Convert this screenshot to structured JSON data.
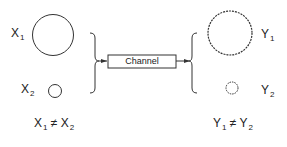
{
  "diagram": {
    "inputs": [
      {
        "symbol": "X",
        "subscript": "1",
        "size": "large"
      },
      {
        "symbol": "X",
        "subscript": "2",
        "size": "small"
      }
    ],
    "input_relation": {
      "left": "X",
      "left_sub": "1",
      "op": "≠",
      "right": "X",
      "right_sub": "2"
    },
    "channel": {
      "label": "Channel"
    },
    "outputs": [
      {
        "symbol": "Y",
        "subscript": "1",
        "size": "large",
        "style": "dotted"
      },
      {
        "symbol": "Y",
        "subscript": "2",
        "size": "small",
        "style": "dotted"
      }
    ],
    "output_relation": {
      "left": "Y",
      "left_sub": "1",
      "op": "≠",
      "right": "Y",
      "right_sub": "2"
    },
    "colors": {
      "stroke": "#333333",
      "background": "#ffffff"
    }
  }
}
